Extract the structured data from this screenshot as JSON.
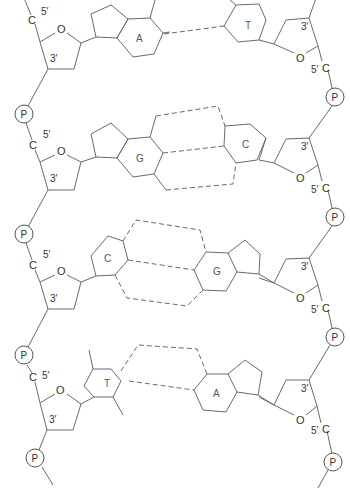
{
  "diagram": {
    "type": "DNA double helix segment (ladder representation)",
    "line_color": "#6a6a6a",
    "labels": {
      "phosphate": "P",
      "carbon": "C",
      "oxygen": "O",
      "five_prime": "5′",
      "three_prime": "3′"
    },
    "base_pairs": [
      {
        "left": "A",
        "right": "T",
        "hydrogen_bonds": 2
      },
      {
        "left": "G",
        "right": "C",
        "hydrogen_bonds": 3
      },
      {
        "left": "C",
        "right": "G",
        "hydrogen_bonds": 3
      },
      {
        "left": "T",
        "right": "A",
        "hydrogen_bonds": 2
      }
    ],
    "left_strand": {
      "nucleotides": [
        {
          "base": "A",
          "five_prime": "5′",
          "three_prime": "3′",
          "carbon": "C",
          "oxygen": "O",
          "phosphate": "P"
        },
        {
          "base": "G",
          "five_prime": "5′",
          "three_prime": "3′",
          "carbon": "C",
          "oxygen": "O",
          "phosphate": "P"
        },
        {
          "base": "C",
          "five_prime": "5′",
          "three_prime": "3′",
          "carbon": "C",
          "oxygen": "O",
          "phosphate": "P"
        },
        {
          "base": "T",
          "five_prime": "5′",
          "three_prime": "3′",
          "carbon": "C",
          "oxygen": "O",
          "phosphate": "P"
        }
      ],
      "top_phosphate": "P"
    },
    "right_strand": {
      "nucleotides": [
        {
          "base": "T",
          "five_prime": "5′",
          "three_prime": "3′",
          "carbon": "C",
          "oxygen": "O",
          "phosphate": "P"
        },
        {
          "base": "C",
          "five_prime": "5′",
          "three_prime": "3′",
          "carbon": "C",
          "oxygen": "O",
          "phosphate": "P"
        },
        {
          "base": "G",
          "five_prime": "5′",
          "three_prime": "3′",
          "carbon": "C",
          "oxygen": "O",
          "phosphate": "P"
        },
        {
          "base": "A",
          "five_prime": "5′",
          "three_prime": "3′",
          "carbon": "C",
          "oxygen": "O",
          "phosphate": "P"
        }
      ]
    }
  }
}
